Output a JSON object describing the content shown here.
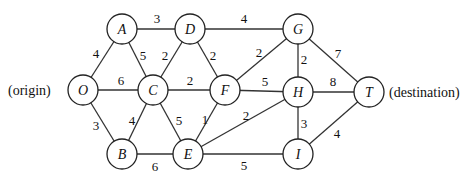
{
  "diagram": {
    "type": "weighted-undirected-graph",
    "side_labels": {
      "origin": "(origin)",
      "destination": "(destination)"
    },
    "nodes": [
      {
        "id": "A",
        "label": "A",
        "x": 122,
        "y": 29
      },
      {
        "id": "D",
        "label": "D",
        "x": 190,
        "y": 29
      },
      {
        "id": "G",
        "label": "G",
        "x": 298,
        "y": 29
      },
      {
        "id": "O",
        "label": "O",
        "x": 83,
        "y": 90
      },
      {
        "id": "C",
        "label": "C",
        "x": 153,
        "y": 90
      },
      {
        "id": "F",
        "label": "F",
        "x": 225,
        "y": 90
      },
      {
        "id": "H",
        "label": "H",
        "x": 298,
        "y": 92
      },
      {
        "id": "T",
        "label": "T",
        "x": 369,
        "y": 92
      },
      {
        "id": "B",
        "label": "B",
        "x": 122,
        "y": 154
      },
      {
        "id": "E",
        "label": "E",
        "x": 188,
        "y": 154
      },
      {
        "id": "I",
        "label": "I",
        "x": 298,
        "y": 154
      }
    ],
    "edges": [
      {
        "from": "O",
        "to": "A",
        "weight": "4",
        "lx": 96,
        "ly": 58
      },
      {
        "from": "O",
        "to": "C",
        "weight": "6",
        "lx": 121,
        "ly": 85
      },
      {
        "from": "O",
        "to": "B",
        "weight": "3",
        "lx": 96,
        "ly": 130
      },
      {
        "from": "A",
        "to": "D",
        "weight": "3",
        "lx": 157,
        "ly": 23
      },
      {
        "from": "A",
        "to": "C",
        "weight": "5",
        "lx": 143,
        "ly": 60
      },
      {
        "from": "D",
        "to": "C",
        "weight": "2",
        "lx": 165,
        "ly": 60
      },
      {
        "from": "D",
        "to": "F",
        "weight": "2",
        "lx": 213,
        "ly": 60
      },
      {
        "from": "D",
        "to": "G",
        "weight": "4",
        "lx": 244,
        "ly": 23
      },
      {
        "from": "C",
        "to": "F",
        "weight": "2",
        "lx": 190,
        "ly": 85
      },
      {
        "from": "C",
        "to": "B",
        "weight": "4",
        "lx": 132,
        "ly": 125
      },
      {
        "from": "C",
        "to": "E",
        "weight": "5",
        "lx": 179,
        "ly": 125
      },
      {
        "from": "B",
        "to": "E",
        "weight": "6",
        "lx": 155,
        "ly": 171
      },
      {
        "from": "F",
        "to": "G",
        "weight": "2",
        "lx": 259,
        "ly": 57
      },
      {
        "from": "F",
        "to": "H",
        "weight": "5",
        "lx": 265,
        "ly": 86
      },
      {
        "from": "F",
        "to": "E",
        "weight": "1",
        "lx": 205,
        "ly": 124
      },
      {
        "from": "E",
        "to": "H",
        "weight": "2",
        "lx": 246,
        "ly": 120
      },
      {
        "from": "E",
        "to": "I",
        "weight": "5",
        "lx": 244,
        "ly": 170
      },
      {
        "from": "G",
        "to": "H",
        "weight": "2",
        "lx": 304,
        "ly": 64
      },
      {
        "from": "G",
        "to": "T",
        "weight": "7",
        "lx": 338,
        "ly": 58
      },
      {
        "from": "H",
        "to": "T",
        "weight": "8",
        "lx": 333,
        "ly": 86
      },
      {
        "from": "H",
        "to": "I",
        "weight": "3",
        "lx": 304,
        "ly": 128
      },
      {
        "from": "I",
        "to": "T",
        "weight": "4",
        "lx": 337,
        "ly": 138
      }
    ]
  }
}
